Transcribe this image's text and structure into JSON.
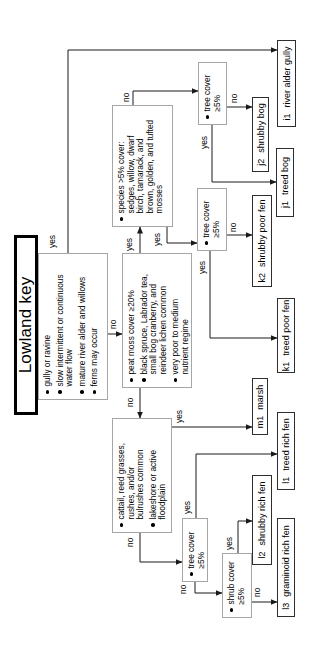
{
  "title": "Lowland key",
  "connector_labels": {
    "yes": "yes",
    "no": "no"
  },
  "decisions": {
    "site": {
      "items": [
        "gully or ravine",
        "slow intermittent or continuous\nwater flow",
        "mature river alder and willows",
        "ferns may occur"
      ]
    },
    "peat": {
      "items": [
        "peat moss cover ≥20%",
        "black spruce, Labrador tea,\nsmall bog cranberry, and\nreindeer lichen common",
        "very poor to medium\nnutrient regime"
      ]
    },
    "species": {
      "items": [
        "species >5% cover:\nsedges, willow, dwarf\nbirch, tamarack, and\nbrown, golden, and tufted\nmosses"
      ]
    },
    "marsh_test": {
      "items": [
        "cattail, reed grasses,\nrushes, and/or\nbulrushes common",
        "lakeshore or active\nfloodplain"
      ]
    },
    "tree_cover_bog": {
      "items": [
        "tree cover\n≥5%"
      ]
    },
    "tree_cover_poor_fen": {
      "items": [
        "tree cover\n≥5%"
      ]
    },
    "tree_cover_rich_fen": {
      "items": [
        "tree cover\n≥5%"
      ]
    },
    "shrub_cover": {
      "items": [
        "shrub cover\n≥5%"
      ]
    }
  },
  "terminals": {
    "i1": {
      "code": "i1",
      "label": "river alder gully"
    },
    "j1": {
      "code": "j1",
      "label": "treed bog"
    },
    "j2": {
      "code": "j2",
      "label": "shrubby bog"
    },
    "k1": {
      "code": "k1",
      "label": "treed poor fen"
    },
    "k2": {
      "code": "k2",
      "label": "shrubby poor fen"
    },
    "m1": {
      "code": "m1",
      "label": "marsh"
    },
    "l1": {
      "code": "l1",
      "label": "treed rich fen"
    },
    "l2": {
      "code": "l2",
      "label": "shrubby rich fen"
    },
    "l3": {
      "code": "l3",
      "label": "graminoid rich fen"
    }
  },
  "colors": {
    "background": "#ffffff",
    "line": "#1a1a1a",
    "text": "#000000",
    "decision_border": "#a6a6a6",
    "terminal_border": "#2e2e2e"
  }
}
